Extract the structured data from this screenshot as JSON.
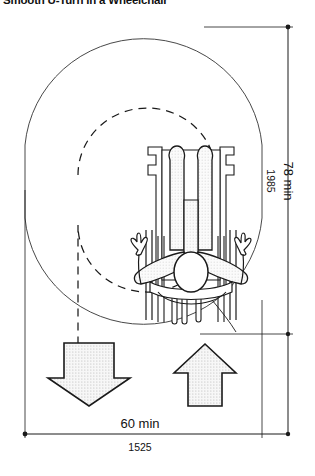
{
  "figure": {
    "title": "Smooth U-Turn in a Wheelchair",
    "caption": "",
    "view": "plan-view-wheelchair-u-turn"
  },
  "dimensions": {
    "vertical": {
      "name": "length",
      "primary_label": "78 min",
      "secondary_label": "1985",
      "primary_unit": "inches",
      "secondary_unit": "millimeters",
      "orientation": "vertical"
    },
    "horizontal": {
      "name": "width",
      "primary_label": "60 min",
      "secondary_label": "1525",
      "primary_unit": "inches",
      "secondary_unit": "millimeters",
      "orientation": "horizontal"
    }
  },
  "arrows": {
    "left": {
      "name": "approach-arrow-down",
      "direction": "down",
      "fill": "stippled"
    },
    "right": {
      "name": "exit-arrow-up",
      "direction": "up",
      "fill": "stippled"
    }
  },
  "paths": {
    "outer": {
      "name": "clear-floor-envelope",
      "style": "solid"
    },
    "inner": {
      "name": "turning-path-centerline",
      "style": "dashed"
    }
  },
  "occupant": {
    "name": "wheelchair-user-plan-view",
    "parts": [
      "head",
      "left-arm",
      "right-arm",
      "left-leg",
      "right-leg",
      "left-wheel",
      "right-wheel",
      "footrests",
      "push-handles"
    ]
  },
  "colors": {
    "line": "#111111",
    "outline_light": "#4a4a4a",
    "stipple_fill": "#f2f2f2",
    "background": "#ffffff"
  }
}
